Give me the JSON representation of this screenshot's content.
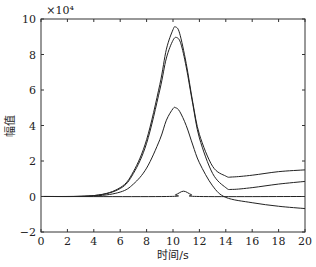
{
  "chart_data": {
    "type": "line",
    "title": "",
    "xlabel": "时间/s",
    "ylabel": "幅值",
    "y_multiplier": "×10⁴",
    "xlim": [
      0,
      20
    ],
    "ylim": [
      -2,
      10
    ],
    "xticks": [
      0,
      2,
      4,
      6,
      8,
      10,
      12,
      14,
      16,
      18,
      20
    ],
    "yticks": [
      -2,
      0,
      2,
      4,
      6,
      8,
      10
    ],
    "grid": false,
    "legend": null,
    "series": [
      {
        "name": "curve-1",
        "x": [
          0,
          4,
          6,
          7,
          8,
          9,
          9.5,
          10,
          10.2,
          10.5,
          11,
          11.5,
          12,
          13,
          14,
          14.5,
          16,
          18,
          20
        ],
        "y": [
          0,
          0.05,
          0.5,
          1.4,
          3.2,
          6.3,
          8.3,
          9.4,
          9.55,
          9.2,
          7.5,
          5.3,
          3.5,
          1.7,
          1.15,
          1.1,
          1.2,
          1.4,
          1.5
        ]
      },
      {
        "name": "curve-2",
        "x": [
          0,
          4,
          6,
          7,
          8,
          9,
          9.5,
          10,
          10.3,
          10.6,
          11,
          11.5,
          12,
          13,
          14,
          14.5,
          16,
          18,
          20
        ],
        "y": [
          0,
          0.05,
          0.45,
          1.3,
          3.0,
          6.0,
          7.8,
          8.8,
          8.95,
          8.6,
          7.3,
          5.2,
          3.3,
          1.3,
          0.5,
          0.4,
          0.5,
          0.7,
          0.85
        ]
      },
      {
        "name": "curve-3",
        "x": [
          0,
          4,
          6,
          7,
          8,
          9,
          9.5,
          10,
          10.2,
          10.5,
          11,
          11.5,
          12,
          13,
          14,
          16,
          18,
          20
        ],
        "y": [
          0,
          0.03,
          0.25,
          0.7,
          1.6,
          3.2,
          4.3,
          4.95,
          5.0,
          4.8,
          4.0,
          2.9,
          1.9,
          0.6,
          -0.05,
          -0.35,
          -0.55,
          -0.68
        ]
      },
      {
        "name": "curve-4",
        "x": [
          0,
          9.5,
          10.2,
          10.8,
          11.4,
          12,
          20
        ],
        "y": [
          0,
          0,
          0.1,
          0.3,
          0.1,
          0,
          0
        ]
      }
    ]
  }
}
